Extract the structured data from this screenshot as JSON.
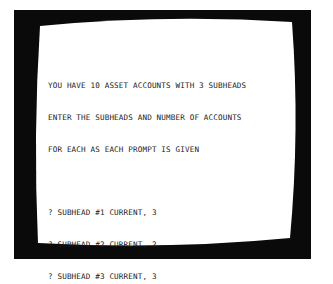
{
  "screen": {
    "bezel_color": "#0a0a0a",
    "screen_color": "#ffffff",
    "text_color": "#1a1a1a"
  },
  "terminal": {
    "message_lines": [
      "YOU HAVE 10 ASSET ACCOUNTS WITH 3 SUBHEADS",
      "ENTER THE SUBHEADS AND NUMBER OF ACCOUNTS",
      "FOR EACH AS EACH PROMPT IS GIVEN"
    ],
    "prompts": [
      {
        "prompt": "? SUBHEAD #1 CURRENT, ",
        "value": "3"
      },
      {
        "prompt": "? SUBHEAD #2 CURRENT, ",
        "value": "2"
      },
      {
        "prompt": "? SUBHEAD #3 CURRENT, ",
        "value": "3"
      }
    ]
  }
}
